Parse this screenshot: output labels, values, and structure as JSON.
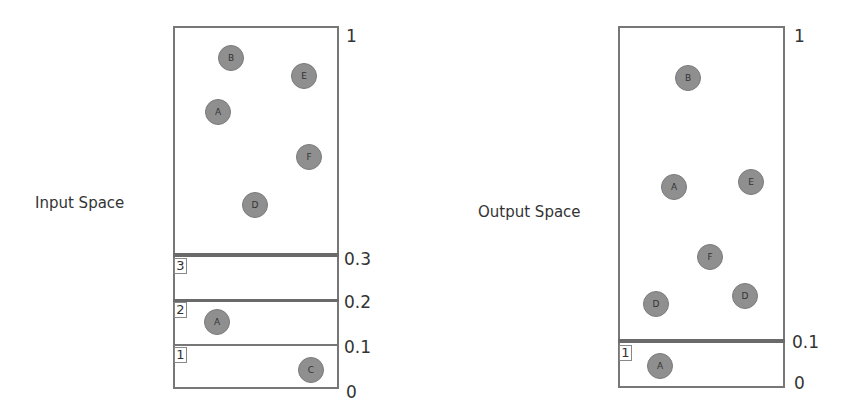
{
  "input_space": {
    "title": "Input Space",
    "axis_labels": {
      "top": "1",
      "t03": "0.3",
      "t02": "0.2",
      "t01": "0.1",
      "bottom": "0"
    },
    "bucket_labels": [
      "3",
      "2",
      "1"
    ],
    "main_points": [
      {
        "label": "B",
        "x": 231,
        "y": 58
      },
      {
        "label": "E",
        "x": 304,
        "y": 76
      },
      {
        "label": "A",
        "x": 218,
        "y": 112
      },
      {
        "label": "F",
        "x": 309,
        "y": 157
      },
      {
        "label": "D",
        "x": 255,
        "y": 205
      }
    ],
    "bucket_points": [
      {
        "bucket": "2",
        "label": "A",
        "x": 217,
        "y": 322
      },
      {
        "bucket": "1",
        "label": "C",
        "x": 311,
        "y": 370
      }
    ]
  },
  "output_space": {
    "title": "Output Space",
    "axis_labels": {
      "top": "1",
      "t01": "0.1",
      "bottom": "0"
    },
    "bucket_labels": [
      "1"
    ],
    "main_points": [
      {
        "label": "B",
        "x": 688,
        "y": 78
      },
      {
        "label": "A",
        "x": 674,
        "y": 187
      },
      {
        "label": "E",
        "x": 751,
        "y": 182
      },
      {
        "label": "F",
        "x": 710,
        "y": 257
      },
      {
        "label": "D",
        "x": 656,
        "y": 304
      },
      {
        "label": "D",
        "x": 745,
        "y": 296
      }
    ],
    "bucket_points": [
      {
        "bucket": "1",
        "label": "A",
        "x": 660,
        "y": 366
      }
    ]
  }
}
